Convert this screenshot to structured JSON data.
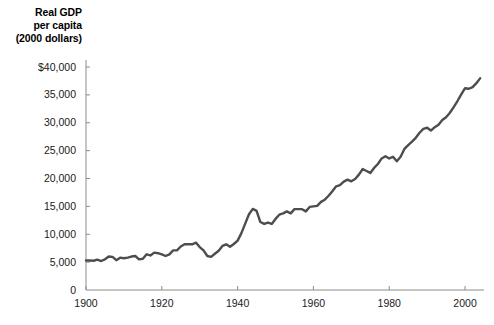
{
  "chart_data": {
    "type": "line",
    "title": "",
    "axis_title_lines": [
      "Real GDP",
      "per capita",
      "(2000 dollars)"
    ],
    "xlabel": "",
    "ylabel": "Real GDP per capita (2000 dollars)",
    "xlim": [
      1900,
      2005
    ],
    "ylim": [
      0,
      40000
    ],
    "grid": false,
    "legend": null,
    "line_color": "#4d4d4d",
    "axis_color": "#808080",
    "xticks": [
      1900,
      1920,
      1940,
      1960,
      1980,
      2000
    ],
    "xtick_labels": [
      "1900",
      "1920",
      "1940",
      "1960",
      "1980",
      "2000"
    ],
    "yticks": [
      0,
      5000,
      10000,
      15000,
      20000,
      25000,
      30000,
      35000,
      40000
    ],
    "ytick_labels": [
      "0",
      "5,000",
      "10,000",
      "15,000",
      "20,000",
      "25,000",
      "30,000",
      "35,000",
      "$40,000"
    ],
    "series": [
      {
        "name": "Real GDP per capita",
        "x": [
          1900,
          1901,
          1902,
          1903,
          1904,
          1905,
          1906,
          1907,
          1908,
          1909,
          1910,
          1911,
          1912,
          1913,
          1914,
          1915,
          1916,
          1917,
          1918,
          1919,
          1920,
          1921,
          1922,
          1923,
          1924,
          1925,
          1926,
          1927,
          1928,
          1929,
          1930,
          1931,
          1932,
          1933,
          1934,
          1935,
          1936,
          1937,
          1938,
          1939,
          1940,
          1941,
          1942,
          1943,
          1944,
          1945,
          1946,
          1947,
          1948,
          1949,
          1950,
          1951,
          1952,
          1953,
          1954,
          1955,
          1956,
          1957,
          1958,
          1959,
          1960,
          1961,
          1962,
          1963,
          1964,
          1965,
          1966,
          1967,
          1968,
          1969,
          1970,
          1971,
          1972,
          1973,
          1974,
          1975,
          1976,
          1977,
          1978,
          1979,
          1980,
          1981,
          1982,
          1983,
          1984,
          1985,
          1986,
          1987,
          1988,
          1989,
          1990,
          1991,
          1992,
          1993,
          1994,
          1995,
          1996,
          1997,
          1998,
          1999,
          2000,
          2001,
          2002,
          2003,
          2004
        ],
        "y": [
          5300,
          5300,
          5250,
          5450,
          5200,
          5500,
          6000,
          5950,
          5350,
          5800,
          5700,
          5800,
          6000,
          6100,
          5500,
          5600,
          6400,
          6200,
          6700,
          6600,
          6400,
          6100,
          6400,
          7100,
          7100,
          7800,
          8200,
          8200,
          8200,
          8500,
          7700,
          7100,
          6100,
          5950,
          6500,
          7050,
          7900,
          8200,
          7750,
          8250,
          8850,
          10200,
          11900,
          13600,
          14550,
          14200,
          12200,
          11850,
          12100,
          11850,
          12750,
          13500,
          13750,
          14100,
          13750,
          14500,
          14500,
          14500,
          14100,
          14900,
          15000,
          15100,
          15800,
          16200,
          16900,
          17700,
          18600,
          18800,
          19450,
          19800,
          19500,
          19900,
          20700,
          21700,
          21350,
          21000,
          21900,
          22600,
          23600,
          24000,
          23600,
          23900,
          23100,
          23900,
          25300,
          26000,
          26600,
          27300,
          28200,
          28900,
          29100,
          28600,
          29200,
          29650,
          30500,
          31000,
          31800,
          32800,
          33900,
          35100,
          36200,
          36100,
          36400,
          37100,
          38000
        ]
      }
    ]
  },
  "plot_geometry": {
    "left_px": 86,
    "right_px": 484,
    "bottom_px": 290,
    "top_px": 67,
    "x_min": 1900,
    "x_max": 2005,
    "y_min": 0,
    "y_max": 40000
  }
}
